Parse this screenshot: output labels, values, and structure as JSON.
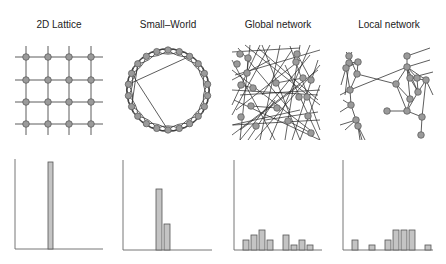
{
  "panels": [
    {
      "id": "lattice",
      "title": "2D Lattice",
      "cx": 59
    },
    {
      "id": "smallworld",
      "title": "Small–World",
      "cx": 168
    },
    {
      "id": "global",
      "title": "Global network",
      "cx": 278
    },
    {
      "id": "local",
      "title": "Local network",
      "cx": 389
    }
  ],
  "colors": {
    "node_fill": "#9a9a9a",
    "node_stroke": "#555555",
    "bar_fill": "#c4c4c4",
    "edge": "#333333"
  },
  "chart_data": [
    {
      "type": "bar",
      "title": "2D Lattice degree distribution",
      "categories": [
        "1",
        "2",
        "3",
        "4",
        "5",
        "6",
        "7",
        "8",
        "9",
        "10",
        "11",
        "12"
      ],
      "values": [
        0,
        0,
        0,
        0,
        1.0,
        0,
        0,
        0,
        0,
        0,
        0,
        0
      ],
      "xlabel": "",
      "ylabel": "",
      "grid": false,
      "axis": {
        "x0": 15,
        "y0": 249,
        "x1": 103,
        "ytop": 159
      },
      "bars": [
        {
          "x": 48,
          "w": 5,
          "h": 87
        }
      ]
    },
    {
      "type": "bar",
      "title": "Small-World degree distribution",
      "values": [
        0.72,
        0.3
      ],
      "xlabel": "",
      "ylabel": "",
      "grid": false,
      "axis": {
        "x0": 123,
        "y0": 250,
        "x1": 212,
        "ytop": 160
      },
      "bars": [
        {
          "x": 156,
          "w": 6,
          "h": 61
        },
        {
          "x": 164,
          "w": 6,
          "h": 26
        }
      ]
    },
    {
      "type": "bar",
      "title": "Global network degree distribution",
      "values": [
        0.11,
        0.16,
        0.21,
        0.11,
        0,
        0.16,
        0.05,
        0.11,
        0.05
      ],
      "xlabel": "",
      "ylabel": "",
      "grid": false,
      "axis": {
        "x0": 234,
        "y0": 250,
        "x1": 322,
        "ytop": 160
      },
      "bars": [
        {
          "x": 243,
          "w": 6,
          "h": 10
        },
        {
          "x": 251,
          "w": 6,
          "h": 15
        },
        {
          "x": 259,
          "w": 6,
          "h": 20
        },
        {
          "x": 267,
          "w": 6,
          "h": 10
        },
        {
          "x": 283,
          "w": 6,
          "h": 15
        },
        {
          "x": 291,
          "w": 6,
          "h": 5
        },
        {
          "x": 299,
          "w": 6,
          "h": 10
        },
        {
          "x": 307,
          "w": 6,
          "h": 5
        }
      ]
    },
    {
      "type": "bar",
      "title": "Local network degree distribution",
      "values": [
        0.11,
        0,
        0.05,
        0,
        0.11,
        0.21,
        0.21,
        0.21,
        0,
        0.05
      ],
      "xlabel": "",
      "ylabel": "",
      "grid": false,
      "axis": {
        "x0": 343,
        "y0": 250,
        "x1": 433,
        "ytop": 160
      },
      "bars": [
        {
          "x": 352,
          "w": 6,
          "h": 10
        },
        {
          "x": 369,
          "w": 6,
          "h": 5
        },
        {
          "x": 385,
          "w": 6,
          "h": 10
        },
        {
          "x": 393,
          "w": 6,
          "h": 20
        },
        {
          "x": 401,
          "w": 6,
          "h": 20
        },
        {
          "x": 409,
          "w": 6,
          "h": 20
        },
        {
          "x": 425,
          "w": 6,
          "h": 5
        }
      ]
    }
  ],
  "lattice": {
    "xs": [
      26,
      48,
      69,
      91
    ],
    "ys": [
      57,
      80,
      102,
      124
    ],
    "xmin": 15,
    "xmax": 103,
    "ymin": 46,
    "ymax": 135
  },
  "smallworld": {
    "cx": 168,
    "cy": 90,
    "r": 40,
    "n": 22,
    "shortcuts": [
      [
        2,
        17
      ],
      [
        18,
        11
      ],
      [
        15,
        19
      ]
    ]
  },
  "global": {
    "nodes": [
      [
        240,
        54
      ],
      [
        248,
        58
      ],
      [
        237,
        64
      ],
      [
        247,
        73
      ],
      [
        241,
        85
      ],
      [
        253,
        88
      ],
      [
        276,
        83
      ],
      [
        297,
        54
      ],
      [
        296,
        62
      ],
      [
        303,
        78
      ],
      [
        311,
        80
      ],
      [
        307,
        97
      ],
      [
        299,
        97
      ],
      [
        288,
        121
      ],
      [
        277,
        108
      ],
      [
        251,
        106
      ],
      [
        241,
        117
      ],
      [
        256,
        126
      ],
      [
        308,
        116
      ],
      [
        311,
        133
      ]
    ],
    "edges": [
      [
        232,
        52,
        300,
        48
      ],
      [
        235,
        75,
        320,
        50
      ],
      [
        232,
        90,
        318,
        95
      ],
      [
        236,
        110,
        300,
        60
      ],
      [
        240,
        140,
        310,
        55
      ],
      [
        233,
        125,
        320,
        120
      ],
      [
        232,
        60,
        275,
        140
      ],
      [
        250,
        45,
        240,
        140
      ],
      [
        262,
        45,
        300,
        140
      ],
      [
        280,
        45,
        260,
        140
      ],
      [
        290,
        46,
        320,
        130
      ],
      [
        300,
        45,
        285,
        140
      ],
      [
        310,
        45,
        270,
        140
      ],
      [
        318,
        60,
        292,
        140
      ],
      [
        320,
        85,
        300,
        140
      ],
      [
        232,
        135,
        318,
        70
      ],
      [
        234,
        100,
        320,
        140
      ],
      [
        245,
        45,
        320,
        105
      ],
      [
        232,
        70,
        310,
        130
      ],
      [
        255,
        140,
        320,
        65
      ],
      [
        238,
        48,
        290,
        110
      ],
      [
        270,
        45,
        232,
        115
      ],
      [
        232,
        80,
        270,
        60
      ],
      [
        285,
        65,
        320,
        140
      ],
      [
        292,
        50,
        262,
        95
      ],
      [
        240,
        95,
        320,
        90
      ],
      [
        248,
        140,
        275,
        100
      ],
      [
        300,
        110,
        232,
        125
      ],
      [
        265,
        120,
        318,
        112
      ],
      [
        232,
        105,
        260,
        45
      ],
      [
        276,
        83,
        303,
        78
      ],
      [
        297,
        54,
        311,
        80
      ],
      [
        241,
        85,
        253,
        88
      ],
      [
        248,
        58,
        247,
        73
      ],
      [
        288,
        121,
        311,
        133
      ],
      [
        251,
        106,
        277,
        108
      ],
      [
        240,
        130,
        300,
        85
      ],
      [
        258,
        48,
        318,
        100
      ]
    ]
  },
  "local": {
    "nodes": [
      [
        349,
        56
      ],
      [
        349,
        63
      ],
      [
        346,
        68
      ],
      [
        358,
        62
      ],
      [
        357,
        74
      ],
      [
        350,
        90
      ],
      [
        351,
        105
      ],
      [
        356,
        120
      ],
      [
        358,
        126
      ],
      [
        407,
        56
      ],
      [
        407,
        67
      ],
      [
        396,
        84
      ],
      [
        410,
        78
      ],
      [
        417,
        78
      ],
      [
        426,
        80
      ],
      [
        418,
        92
      ],
      [
        410,
        99
      ],
      [
        407,
        111
      ],
      [
        387,
        111
      ],
      [
        422,
        117
      ],
      [
        421,
        135
      ]
    ],
    "edges": [
      [
        349,
        56,
        357,
        74
      ],
      [
        346,
        68,
        350,
        90
      ],
      [
        358,
        62,
        357,
        74
      ],
      [
        357,
        74,
        350,
        90
      ],
      [
        350,
        90,
        351,
        105
      ],
      [
        351,
        105,
        356,
        120
      ],
      [
        349,
        63,
        358,
        62
      ],
      [
        346,
        68,
        358,
        62
      ],
      [
        357,
        74,
        396,
        84
      ],
      [
        350,
        90,
        407,
        67
      ],
      [
        350,
        90,
        340,
        95
      ],
      [
        351,
        105,
        340,
        112
      ],
      [
        356,
        120,
        340,
        125
      ],
      [
        356,
        120,
        345,
        130
      ],
      [
        358,
        126,
        365,
        140
      ],
      [
        358,
        126,
        362,
        140
      ],
      [
        358,
        126,
        360,
        140
      ],
      [
        396,
        84,
        407,
        67
      ],
      [
        396,
        84,
        410,
        99
      ],
      [
        396,
        84,
        407,
        111
      ],
      [
        407,
        56,
        407,
        67
      ],
      [
        407,
        56,
        430,
        48
      ],
      [
        407,
        67,
        410,
        78
      ],
      [
        407,
        67,
        417,
        78
      ],
      [
        407,
        67,
        426,
        80
      ],
      [
        407,
        67,
        418,
        92
      ],
      [
        407,
        67,
        410,
        99
      ],
      [
        407,
        67,
        430,
        60
      ],
      [
        410,
        78,
        418,
        92
      ],
      [
        417,
        78,
        418,
        92
      ],
      [
        426,
        80,
        418,
        92
      ],
      [
        426,
        80,
        433,
        95
      ],
      [
        410,
        78,
        426,
        80
      ],
      [
        418,
        92,
        407,
        111
      ],
      [
        410,
        99,
        407,
        111
      ],
      [
        407,
        111,
        387,
        111
      ],
      [
        407,
        111,
        422,
        117
      ],
      [
        422,
        117,
        421,
        135
      ],
      [
        426,
        80,
        422,
        117
      ],
      [
        410,
        78,
        433,
        72
      ],
      [
        349,
        56,
        352,
        52
      ],
      [
        346,
        52,
        352,
        58
      ],
      [
        343,
        100,
        351,
        105
      ],
      [
        346,
        68,
        341,
        85
      ],
      [
        349,
        63,
        345,
        95
      ]
    ]
  }
}
